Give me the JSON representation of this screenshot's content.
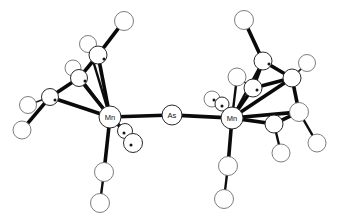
{
  "figure": {
    "name": "molecular-structure-diagram",
    "style": "ortep-ball-and-stick",
    "background_color": "#ffffff",
    "bond_color": "#0a0a0a",
    "atom_outline_color": "#2b2b2b",
    "atom_fill_color": "#ffffff",
    "width": 345,
    "height": 222
  },
  "labels": {
    "mn_left": "Mn",
    "mn_right": "Mn",
    "as_bridge": "As"
  },
  "labeled_atoms": [
    {
      "id": "mn-left",
      "label": "Mn",
      "cx": 110,
      "cy": 117,
      "r": 11
    },
    {
      "id": "as-bridge",
      "label": "As",
      "cx": 172,
      "cy": 115,
      "r": 10
    },
    {
      "id": "mn-right",
      "label": "Mn",
      "cx": 232,
      "cy": 118,
      "r": 11
    }
  ],
  "atoms": [
    {
      "id": "a1",
      "cx": 124,
      "cy": 21,
      "r": 9.5,
      "style": "soft"
    },
    {
      "id": "a2",
      "cx": 88,
      "cy": 44,
      "r": 8.5,
      "style": "soft"
    },
    {
      "id": "a3",
      "cx": 98,
      "cy": 55,
      "r": 9.0,
      "style": "hard"
    },
    {
      "id": "a4",
      "cx": 73,
      "cy": 68,
      "r": 8.0,
      "style": "soft"
    },
    {
      "id": "a5",
      "cx": 79,
      "cy": 78,
      "r": 8.5,
      "style": "hard"
    },
    {
      "id": "a6",
      "cx": 50,
      "cy": 97,
      "r": 8.5,
      "style": "hard"
    },
    {
      "id": "a7",
      "cx": 28,
      "cy": 105,
      "r": 8.5,
      "style": "soft"
    },
    {
      "id": "a8",
      "cx": 22,
      "cy": 130,
      "r": 9.0,
      "style": "soft"
    },
    {
      "id": "a9",
      "cx": 125,
      "cy": 131,
      "r": 7.5,
      "style": "hard"
    },
    {
      "id": "a10",
      "cx": 133,
      "cy": 143,
      "r": 9.5,
      "style": "hard"
    },
    {
      "id": "a11",
      "cx": 104,
      "cy": 172,
      "r": 9.5,
      "style": "soft"
    },
    {
      "id": "a12",
      "cx": 100,
      "cy": 203,
      "r": 9.5,
      "style": "soft"
    },
    {
      "id": "a13",
      "cx": 244,
      "cy": 20,
      "r": 9.5,
      "style": "soft"
    },
    {
      "id": "a14",
      "cx": 263,
      "cy": 61,
      "r": 9.0,
      "style": "hard"
    },
    {
      "id": "a15",
      "cx": 237,
      "cy": 77,
      "r": 9.0,
      "style": "soft"
    },
    {
      "id": "a16",
      "cx": 253,
      "cy": 88,
      "r": 9.0,
      "style": "hard"
    },
    {
      "id": "a17",
      "cx": 292,
      "cy": 78,
      "r": 9.0,
      "style": "hard"
    },
    {
      "id": "a18",
      "cx": 307,
      "cy": 63,
      "r": 8.5,
      "style": "soft"
    },
    {
      "id": "a19",
      "cx": 299,
      "cy": 112,
      "r": 9.5,
      "style": "soft"
    },
    {
      "id": "a20",
      "cx": 274,
      "cy": 124,
      "r": 9.0,
      "style": "hard"
    },
    {
      "id": "a21",
      "cx": 317,
      "cy": 143,
      "r": 9.0,
      "style": "soft"
    },
    {
      "id": "a22",
      "cx": 281,
      "cy": 153,
      "r": 9.0,
      "style": "soft"
    },
    {
      "id": "a23",
      "cx": 212,
      "cy": 99,
      "r": 8.0,
      "style": "soft"
    },
    {
      "id": "a24",
      "cx": 222,
      "cy": 104,
      "r": 7.0,
      "style": "hard"
    },
    {
      "id": "a25",
      "cx": 228,
      "cy": 166,
      "r": 9.5,
      "style": "soft"
    },
    {
      "id": "a26",
      "cx": 224,
      "cy": 199,
      "r": 9.5,
      "style": "soft"
    }
  ],
  "bonds": [
    {
      "from": "a1",
      "to": "a3",
      "weight": "thick"
    },
    {
      "from": "a2",
      "to": "a3",
      "weight": "thin"
    },
    {
      "from": "a3",
      "to": "a5",
      "weight": "thick"
    },
    {
      "from": "a4",
      "to": "a5",
      "weight": "thin"
    },
    {
      "from": "a5",
      "to": "a6",
      "weight": "thick"
    },
    {
      "from": "a6",
      "to": "a7",
      "weight": "thin"
    },
    {
      "from": "a6",
      "to": "a8",
      "weight": "thick"
    },
    {
      "from": "a3",
      "to": "mn-left",
      "weight": "thick"
    },
    {
      "from": "a5",
      "to": "mn-left",
      "weight": "thick"
    },
    {
      "from": "a6",
      "to": "mn-left",
      "weight": "thick"
    },
    {
      "from": "a2",
      "to": "mn-left",
      "weight": "med"
    },
    {
      "from": "a4",
      "to": "mn-left",
      "weight": "med"
    },
    {
      "from": "mn-left",
      "to": "a9",
      "weight": "thick"
    },
    {
      "from": "mn-left",
      "to": "a11",
      "weight": "thick"
    },
    {
      "from": "a11",
      "to": "a12",
      "weight": "med"
    },
    {
      "from": "mn-left",
      "to": "as-bridge",
      "weight": "thick"
    },
    {
      "from": "as-bridge",
      "to": "mn-right",
      "weight": "thick"
    },
    {
      "from": "a13",
      "to": "a14",
      "weight": "thick"
    },
    {
      "from": "a14",
      "to": "a16",
      "weight": "thick"
    },
    {
      "from": "a15",
      "to": "a16",
      "weight": "thin"
    },
    {
      "from": "a14",
      "to": "a17",
      "weight": "thick"
    },
    {
      "from": "a17",
      "to": "a18",
      "weight": "thin"
    },
    {
      "from": "a16",
      "to": "a17",
      "weight": "thick"
    },
    {
      "from": "a17",
      "to": "a19",
      "weight": "thick"
    },
    {
      "from": "a19",
      "to": "a20",
      "weight": "thick"
    },
    {
      "from": "a19",
      "to": "a21",
      "weight": "med"
    },
    {
      "from": "a20",
      "to": "a22",
      "weight": "med"
    },
    {
      "from": "a14",
      "to": "mn-right",
      "weight": "med"
    },
    {
      "from": "a15",
      "to": "mn-right",
      "weight": "med"
    },
    {
      "from": "a16",
      "to": "mn-right",
      "weight": "thick"
    },
    {
      "from": "a17",
      "to": "mn-right",
      "weight": "thick"
    },
    {
      "from": "a19",
      "to": "mn-right",
      "weight": "thick"
    },
    {
      "from": "a20",
      "to": "mn-right",
      "weight": "thick"
    },
    {
      "from": "mn-right",
      "to": "a23",
      "weight": "med"
    },
    {
      "from": "mn-right",
      "to": "a25",
      "weight": "thick"
    },
    {
      "from": "a25",
      "to": "a26",
      "weight": "med"
    }
  ],
  "ellipsoid_dots": [
    {
      "cx": 104,
      "cy": 59
    },
    {
      "cx": 85,
      "cy": 81
    },
    {
      "cx": 55,
      "cy": 100
    },
    {
      "cx": 124,
      "cy": 133
    },
    {
      "cx": 131,
      "cy": 145
    },
    {
      "cx": 214,
      "cy": 100
    },
    {
      "cx": 222,
      "cy": 106
    },
    {
      "cx": 257,
      "cy": 90
    },
    {
      "cx": 269,
      "cy": 64
    }
  ]
}
